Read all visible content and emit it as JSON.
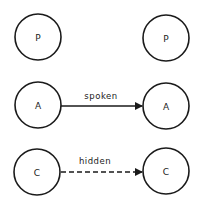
{
  "diagram": {
    "nodes": [
      {
        "id": "p-left",
        "label": "P",
        "cx": 38,
        "cy": 37
      },
      {
        "id": "p-right",
        "label": "P",
        "cx": 166,
        "cy": 38
      },
      {
        "id": "a-left",
        "label": "A",
        "cx": 38,
        "cy": 105
      },
      {
        "id": "a-right",
        "label": "A",
        "cx": 166,
        "cy": 106
      },
      {
        "id": "c-left",
        "label": "C",
        "cx": 37,
        "cy": 172
      },
      {
        "id": "c-right",
        "label": "C",
        "cx": 166,
        "cy": 171
      }
    ],
    "edges": [
      {
        "from": "a-left",
        "to": "a-right",
        "label": "spoken",
        "style": "solid"
      },
      {
        "from": "c-left",
        "to": "c-right",
        "label": "hidden",
        "style": "dashed"
      }
    ],
    "colors": {
      "stroke": "#1a1a1a",
      "background": "#ffffff"
    }
  }
}
